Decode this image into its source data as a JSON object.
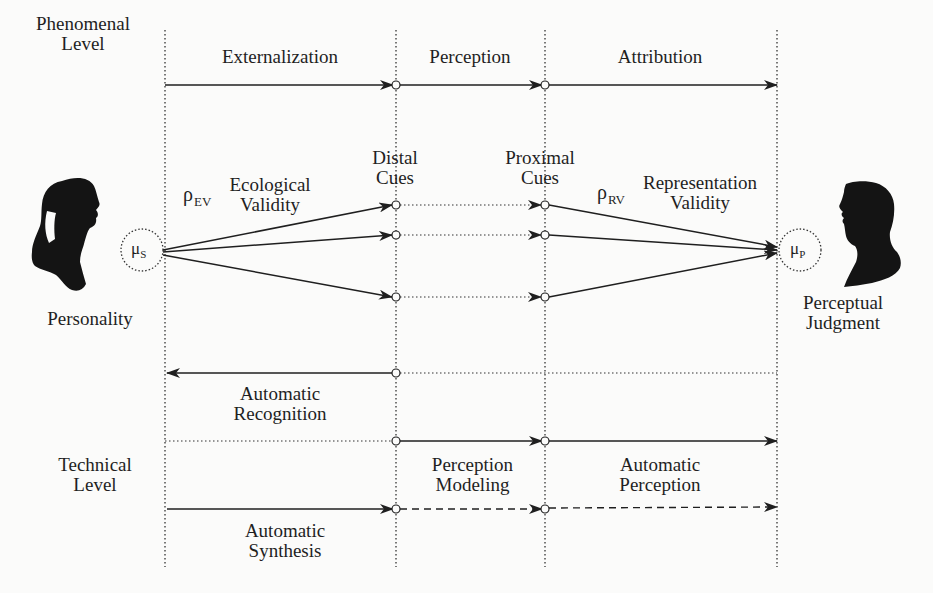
{
  "diagram": {
    "colors": {
      "ink": "#1f1f1f",
      "background": "#fbfbfa"
    },
    "levels": {
      "phenomenal": [
        "Phenomenal",
        "Level"
      ],
      "technical": [
        "Technical",
        "Level"
      ]
    },
    "phases": {
      "externalization": "Externalization",
      "perception": "Perception",
      "attribution": "Attribution"
    },
    "cues": {
      "distal": [
        "Distal",
        "Cues"
      ],
      "proximal": [
        "Proximal",
        "Cues"
      ]
    },
    "validity": {
      "ecological": {
        "symbol": "ρ",
        "subscript": "EV",
        "label": [
          "Ecological",
          "Validity"
        ]
      },
      "representation": {
        "symbol": "ρ",
        "subscript": "RV",
        "label": [
          "Representation",
          "Validity"
        ]
      }
    },
    "nodes": {
      "speaker": {
        "symbol": "μ",
        "subscript": "S",
        "caption": "Personality"
      },
      "perceiver": {
        "symbol": "μ",
        "subscript": "P",
        "caption": [
          "Perceptual",
          "Judgment"
        ]
      }
    },
    "technical": {
      "automatic_recognition": [
        "Automatic",
        "Recognition"
      ],
      "perception_modeling": [
        "Perception",
        "Modeling"
      ],
      "automatic_perception": [
        "Automatic",
        "Perception"
      ],
      "automatic_synthesis": [
        "Automatic",
        "Synthesis"
      ]
    },
    "icons": {
      "speaker": "female-silhouette-icon",
      "perceiver": "male-silhouette-icon"
    }
  }
}
